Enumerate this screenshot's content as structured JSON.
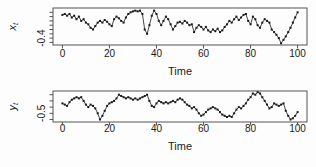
{
  "figure": {
    "background": "#fdfdfd",
    "line_color": "#1a1a1a",
    "frame_color": "#555555"
  },
  "chart_data": [
    {
      "type": "line",
      "name": "xt",
      "ylabel_var": "x",
      "ylabel_sub": "t",
      "xlabel": "Time",
      "x_ticks": [
        0,
        20,
        40,
        60,
        80,
        100
      ],
      "y_ticks": [
        -0.45,
        -0.4,
        -0.35,
        -0.3,
        -0.25,
        -0.2,
        -0.15,
        -0.1
      ],
      "y_labeled_ticks": [
        {
          "value": -0.4,
          "label": "-0.4"
        }
      ],
      "xlim": [
        -4,
        104
      ],
      "ylim": [
        -0.48,
        -0.05
      ],
      "x_range": [
        0,
        100
      ],
      "grid": false,
      "legend": "none",
      "values": [
        -0.13,
        -0.12,
        -0.14,
        -0.12,
        -0.16,
        -0.14,
        -0.18,
        -0.15,
        -0.2,
        -0.18,
        -0.22,
        -0.24,
        -0.28,
        -0.3,
        -0.26,
        -0.22,
        -0.2,
        -0.22,
        -0.19,
        -0.21,
        -0.24,
        -0.26,
        -0.18,
        -0.15,
        -0.17,
        -0.2,
        -0.22,
        -0.16,
        -0.12,
        -0.1,
        -0.09,
        -0.08,
        -0.09,
        -0.08,
        -0.12,
        -0.3,
        -0.35,
        -0.25,
        -0.14,
        -0.08,
        -0.12,
        -0.2,
        -0.25,
        -0.2,
        -0.15,
        -0.18,
        -0.24,
        -0.3,
        -0.26,
        -0.22,
        -0.21,
        -0.23,
        -0.2,
        -0.22,
        -0.25,
        -0.24,
        -0.33,
        -0.28,
        -0.25,
        -0.27,
        -0.3,
        -0.27,
        -0.31,
        -0.33,
        -0.3,
        -0.32,
        -0.29,
        -0.33,
        -0.31,
        -0.27,
        -0.24,
        -0.2,
        -0.22,
        -0.18,
        -0.15,
        -0.19,
        -0.16,
        -0.13,
        -0.12,
        -0.2,
        -0.24,
        -0.15,
        -0.18,
        -0.25,
        -0.28,
        -0.22,
        -0.18,
        -0.2,
        -0.22,
        -0.3,
        -0.33,
        -0.36,
        -0.4,
        -0.46,
        -0.42,
        -0.38,
        -0.33,
        -0.28,
        -0.22,
        -0.16,
        -0.1
      ]
    },
    {
      "type": "line",
      "name": "yt",
      "ylabel_var": "y",
      "ylabel_sub": "t",
      "xlabel": "Time",
      "x_ticks": [
        0,
        20,
        40,
        60,
        80,
        100
      ],
      "y_ticks": [
        -0.55,
        -0.5,
        -0.45,
        -0.4,
        -0.35
      ],
      "y_labeled_ticks": [
        {
          "value": -0.5,
          "label": "-0.5"
        }
      ],
      "xlim": [
        -4,
        104
      ],
      "ylim": [
        -0.57,
        -0.32
      ],
      "x_range": [
        0,
        100
      ],
      "grid": false,
      "legend": "none",
      "values": [
        -0.42,
        -0.43,
        -0.44,
        -0.41,
        -0.39,
        -0.38,
        -0.37,
        -0.38,
        -0.37,
        -0.4,
        -0.43,
        -0.45,
        -0.43,
        -0.44,
        -0.46,
        -0.5,
        -0.55,
        -0.52,
        -0.48,
        -0.44,
        -0.42,
        -0.41,
        -0.4,
        -0.38,
        -0.35,
        -0.36,
        -0.37,
        -0.38,
        -0.37,
        -0.38,
        -0.39,
        -0.38,
        -0.39,
        -0.38,
        -0.37,
        -0.36,
        -0.35,
        -0.4,
        -0.44,
        -0.45,
        -0.42,
        -0.4,
        -0.41,
        -0.42,
        -0.41,
        -0.42,
        -0.41,
        -0.4,
        -0.41,
        -0.39,
        -0.38,
        -0.39,
        -0.41,
        -0.43,
        -0.44,
        -0.46,
        -0.45,
        -0.47,
        -0.5,
        -0.52,
        -0.51,
        -0.49,
        -0.47,
        -0.46,
        -0.45,
        -0.46,
        -0.47,
        -0.49,
        -0.51,
        -0.52,
        -0.53,
        -0.52,
        -0.53,
        -0.5,
        -0.47,
        -0.45,
        -0.46,
        -0.44,
        -0.42,
        -0.39,
        -0.37,
        -0.34,
        -0.35,
        -0.33,
        -0.34,
        -0.37,
        -0.4,
        -0.43,
        -0.46,
        -0.45,
        -0.42,
        -0.43,
        -0.44,
        -0.43,
        -0.42,
        -0.48,
        -0.52,
        -0.55,
        -0.54,
        -0.52,
        -0.49
      ]
    }
  ]
}
